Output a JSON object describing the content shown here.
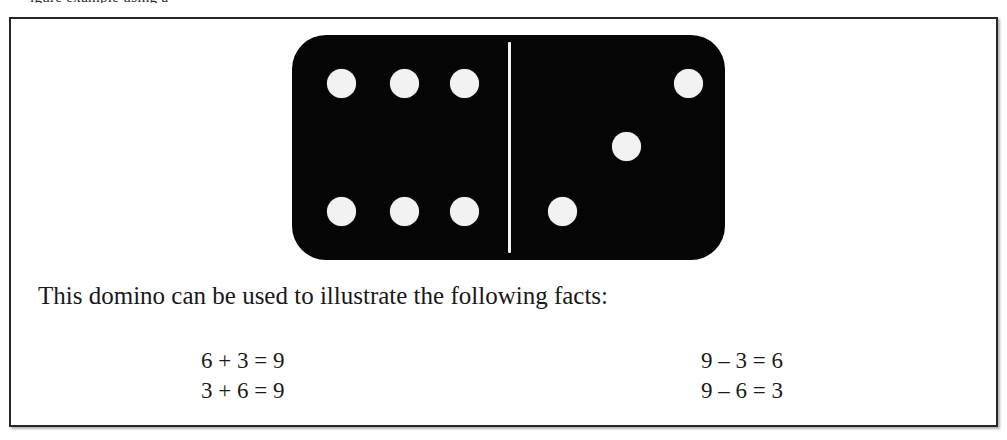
{
  "page": {
    "clipped_header_fragment": "igure   example using a",
    "background_color": "#ffffff"
  },
  "figure": {
    "frame_color": "#272727",
    "domino": {
      "body_color": "#050505",
      "pip_color": "#f2f2f2",
      "divider_color": "#f4f4f4",
      "left_half_pips": 6,
      "right_half_pips": 3,
      "total_pips": 9,
      "left_pip_positions": [
        {
          "x": 35,
          "y": 34
        },
        {
          "x": 98,
          "y": 34
        },
        {
          "x": 158,
          "y": 34
        },
        {
          "x": 35,
          "y": 162
        },
        {
          "x": 98,
          "y": 162
        },
        {
          "x": 158,
          "y": 162
        }
      ],
      "right_pip_positions": [
        {
          "x": 382,
          "y": 34
        },
        {
          "x": 320,
          "y": 97
        },
        {
          "x": 256,
          "y": 162
        }
      ]
    },
    "caption": "This domino can be used to illustrate the following facts:",
    "facts": {
      "addition": [
        "6 + 3 = 9",
        "3 + 6 = 9"
      ],
      "subtraction": [
        "9 – 3 = 6",
        "9 – 6 = 3"
      ]
    }
  }
}
